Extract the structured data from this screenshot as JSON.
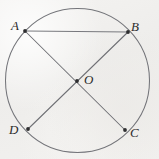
{
  "figure": {
    "kind": "circle-with-two-diameters-and-chord",
    "canvas": {
      "width": 159,
      "height": 159
    },
    "background_color": "#f1f0ee",
    "ink_color": "#6e6e70",
    "label_color": "#2c2c2c",
    "circle": {
      "center_label": "O",
      "center_x": 77.5,
      "center_y": 80.5,
      "radius": 72.0,
      "stroke_width": 1.0
    },
    "points": [
      {
        "id": "A",
        "label": "A",
        "x": 25,
        "y": 31,
        "label_x": 11,
        "label_y": 19
      },
      {
        "id": "B",
        "label": "B",
        "x": 128,
        "y": 32,
        "label_x": 131,
        "label_y": 20
      },
      {
        "id": "C",
        "label": "C",
        "x": 125,
        "y": 130,
        "label_x": 130,
        "label_y": 126
      },
      {
        "id": "D",
        "label": "D",
        "x": 28,
        "y": 129,
        "label_x": 9,
        "label_y": 123
      },
      {
        "id": "O",
        "label": "O",
        "x": 77,
        "y": 81,
        "label_x": 84,
        "label_y": 73
      }
    ],
    "segments": [
      {
        "id": "AC",
        "from": "A",
        "to": "C",
        "role": "diameter"
      },
      {
        "id": "BD",
        "from": "B",
        "to": "D",
        "role": "diameter"
      },
      {
        "id": "AB",
        "from": "A",
        "to": "B",
        "role": "chord"
      }
    ]
  }
}
